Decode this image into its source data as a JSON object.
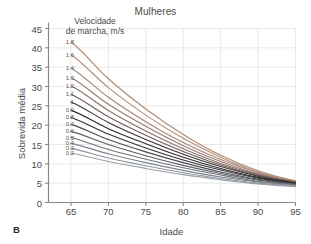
{
  "panel": {
    "label": "B"
  },
  "chart_data": {
    "type": "line",
    "title": "Mulheres",
    "xlabel": "Idade",
    "ylabel": "Sobrevida média",
    "xlim": [
      62,
      95
    ],
    "ylim": [
      0,
      45
    ],
    "xticks": [
      65,
      70,
      75,
      80,
      85,
      90,
      95
    ],
    "yticks": [
      0,
      5,
      10,
      15,
      20,
      25,
      30,
      35,
      40,
      45
    ],
    "grid": true,
    "legend_position": "inside-upper-left",
    "legend_title": "Velocidade de marcha, m/s",
    "legend_title_line1": "Velocidade",
    "legend_title_line2": "de marcha, m/s",
    "x": [
      65,
      70,
      75,
      80,
      85,
      90,
      95
    ],
    "series": [
      {
        "name": "1.8",
        "color": "#b08a70",
        "values": [
          41.5,
          32.0,
          24.2,
          17.6,
          12.2,
          8.2,
          5.6
        ]
      },
      {
        "name": "1.6",
        "color": "#b28f78",
        "values": [
          38.2,
          29.7,
          22.6,
          16.6,
          11.7,
          7.9,
          5.5
        ]
      },
      {
        "name": "1.4",
        "color": "#a88577",
        "values": [
          34.8,
          27.2,
          20.9,
          15.5,
          11.1,
          7.7,
          5.4
        ]
      },
      {
        "name": "1.3",
        "color": "#9a7c72",
        "values": [
          32.3,
          25.4,
          19.7,
          14.7,
          10.6,
          7.4,
          5.3
        ]
      },
      {
        "name": "1.2",
        "color": "#8a716b",
        "values": [
          30.2,
          23.8,
          18.5,
          13.9,
          10.1,
          7.2,
          5.2
        ]
      },
      {
        "name": "1.1",
        "color": "#6e5d5c",
        "values": [
          28.0,
          22.2,
          17.4,
          13.2,
          9.7,
          7.0,
          5.2
        ]
      },
      {
        "name": "1",
        "color": "#3b3431",
        "values": [
          26.0,
          20.7,
          16.3,
          12.5,
          9.3,
          6.8,
          5.1
        ]
      },
      {
        "name": "0.9",
        "color": "#2e2c2b",
        "values": [
          23.9,
          19.1,
          15.2,
          11.7,
          8.8,
          6.5,
          5.0
        ]
      },
      {
        "name": "0.8",
        "color": "#333433",
        "values": [
          22.0,
          17.7,
          14.1,
          11.0,
          8.4,
          6.3,
          4.9
        ]
      },
      {
        "name": "0.7",
        "color": "#4a4c50",
        "values": [
          20.2,
          16.3,
          13.1,
          10.3,
          7.9,
          6.0,
          4.8
        ]
      },
      {
        "name": "0.6",
        "color": "#5d6167",
        "values": [
          18.4,
          15.0,
          12.1,
          9.6,
          7.5,
          5.8,
          4.7
        ]
      },
      {
        "name": "0.5",
        "color": "#6e737a",
        "values": [
          16.8,
          13.7,
          11.2,
          9.0,
          7.1,
          5.5,
          4.6
        ]
      },
      {
        "name": "0.4",
        "color": "#7d838b",
        "values": [
          15.3,
          12.6,
          10.3,
          8.3,
          6.6,
          5.3,
          4.4
        ]
      },
      {
        "name": "0.3",
        "color": "#8d949c",
        "values": [
          14.0,
          11.5,
          9.5,
          7.7,
          6.2,
          5.0,
          4.3
        ]
      },
      {
        "name": "0.2",
        "color": "#9aa1a9",
        "values": [
          12.8,
          10.6,
          8.8,
          7.2,
          5.9,
          4.8,
          4.1
        ]
      }
    ]
  }
}
